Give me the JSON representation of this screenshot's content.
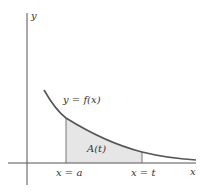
{
  "diagram": {
    "axis_y_label": "y",
    "axis_x_label": "x",
    "curve_label": "y = f(x)",
    "area_label": "A(t)",
    "left_bound_label": "x = a",
    "right_bound_label": "x = t",
    "colors": {
      "axis": "#555555",
      "curve": "#555555",
      "fill": "#e6e6e6",
      "text": "#333333"
    }
  }
}
